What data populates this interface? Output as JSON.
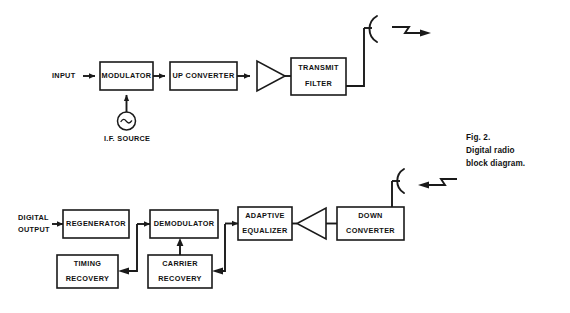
{
  "figure": {
    "caption": {
      "line1": "Fig. 2.",
      "line2": "Digital radio",
      "line3": "block diagram."
    }
  },
  "transmit_chain": {
    "input_label": "INPUT",
    "blocks": [
      {
        "id": "modulator",
        "line1": "MODULATOR",
        "line2": ""
      },
      {
        "id": "up-converter",
        "line1": "UP  CONVERTER",
        "line2": ""
      },
      {
        "id": "transmit-filter",
        "line1": "TRANSMIT",
        "line2": "FILTER"
      }
    ],
    "amplifier": {
      "id": "transmit-amplifier",
      "direction": "right"
    },
    "oscillator": {
      "id": "if-source",
      "label": "I.F. SOURCE",
      "symbol": "sine-wave"
    },
    "antenna": {
      "id": "transmit-antenna",
      "direction": "outgoing"
    }
  },
  "receive_chain": {
    "output_label_line1": "DIGITAL",
    "output_label_line2": "OUTPUT",
    "blocks": [
      {
        "id": "regenerator",
        "line1": "REGENERATOR",
        "line2": ""
      },
      {
        "id": "demodulator",
        "line1": "DEMODULATOR",
        "line2": ""
      },
      {
        "id": "adaptive-equalizer",
        "line1": "ADAPTIVE",
        "line2": "EQUALIZER"
      },
      {
        "id": "down-converter",
        "line1": "DOWN",
        "line2": "CONVERTER"
      },
      {
        "id": "timing-recovery",
        "line1": "TIMING",
        "line2": "RECOVERY"
      },
      {
        "id": "carrier-recovery",
        "line1": "CARRIER",
        "line2": "RECOVERY"
      }
    ],
    "amplifier": {
      "id": "receive-amplifier",
      "direction": "left"
    },
    "antenna": {
      "id": "receive-antenna",
      "direction": "incoming"
    }
  },
  "style": {
    "line_color": "#1a1a1a",
    "background": "#ffffff"
  }
}
